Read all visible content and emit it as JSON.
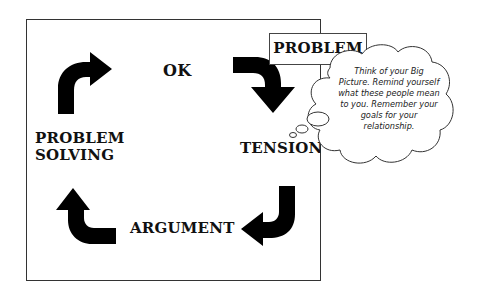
{
  "diagram": {
    "type": "cycle",
    "stages": [
      {
        "id": "ok",
        "label": "OK"
      },
      {
        "id": "tension",
        "label": "TENSION"
      },
      {
        "id": "argument",
        "label": "ARGUMENT"
      },
      {
        "id": "problem_solving",
        "label_line1": "PROBLEM",
        "label_line2": "SOLVING"
      }
    ],
    "trigger": {
      "label": "PROBLEM"
    },
    "thought_bubble": {
      "text": "Think of your Big Picture. Remind yourself what these people mean to you. Remember your goals for your relationship."
    },
    "arrows": [
      {
        "from": "problem_solving",
        "to": "ok",
        "direction": "up-then-right"
      },
      {
        "from": "ok",
        "to": "tension",
        "direction": "right-then-down"
      },
      {
        "from": "tension",
        "to": "argument",
        "direction": "down-then-left"
      },
      {
        "from": "argument",
        "to": "problem_solving",
        "direction": "left-then-up"
      }
    ],
    "colors": {
      "arrow": "#000000",
      "border": "#333333",
      "text": "#111111",
      "background": "#ffffff"
    }
  }
}
